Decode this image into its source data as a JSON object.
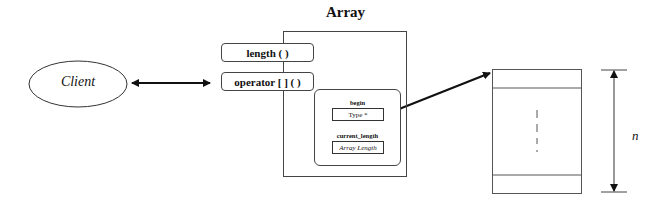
{
  "diagram": {
    "title": "Array",
    "client": {
      "label": "Client"
    },
    "methods": [
      {
        "label": "length ( )"
      },
      {
        "label": "operator [ ] ( )"
      }
    ],
    "members": [
      {
        "name": "begin",
        "value": "Type *"
      },
      {
        "name": "current_length",
        "value": "Array Length"
      }
    ],
    "storage": {
      "dimension_label": "n"
    }
  }
}
